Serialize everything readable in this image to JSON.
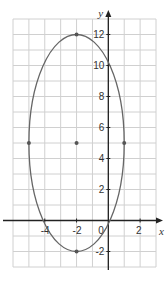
{
  "chart_data": {
    "type": "scatter",
    "title": "",
    "xlabel": "x",
    "ylabel": "y",
    "xlim": [
      -6,
      3
    ],
    "ylim": [
      -3,
      13
    ],
    "grid": true,
    "x_ticks": [
      {
        "value": -4,
        "label": "-4"
      },
      {
        "value": -2,
        "label": "-2"
      },
      {
        "value": 0,
        "label": "0"
      },
      {
        "value": 2,
        "label": "2"
      }
    ],
    "y_ticks": [
      {
        "value": -2,
        "label": "-2"
      },
      {
        "value": 2,
        "label": "2"
      },
      {
        "value": 4,
        "label": "4"
      },
      {
        "value": 6,
        "label": "6"
      },
      {
        "value": 8,
        "label": "8"
      },
      {
        "value": 10,
        "label": "10"
      },
      {
        "value": 12,
        "label": "12"
      }
    ],
    "curves": [
      {
        "name": "ellipse",
        "shape": "ellipse",
        "center": [
          -2,
          5
        ],
        "rx": 3,
        "ry": 7,
        "color": "#666666"
      }
    ],
    "points": [
      {
        "label": "center",
        "x": -2,
        "y": 5
      },
      {
        "label": "top vertex",
        "x": -2,
        "y": 12
      },
      {
        "label": "bottom vertex",
        "x": -2,
        "y": -2
      },
      {
        "label": "left co-vertex",
        "x": -5,
        "y": 5
      },
      {
        "label": "right co-vertex",
        "x": 1,
        "y": 5
      }
    ],
    "colors": {
      "grid": "#d0d0d0",
      "axis": "#222222",
      "curve": "#666666",
      "point": "#555555"
    }
  }
}
